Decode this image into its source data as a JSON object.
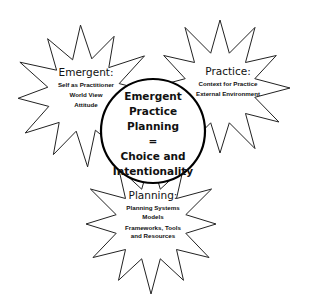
{
  "diagram": {
    "type": "concept-diagram",
    "colors": {
      "stroke": "#222222",
      "fill": "#ffffff",
      "text": "#111111",
      "hub_stroke": "#000000"
    },
    "hub": {
      "lines": [
        "Emergent",
        "Practice",
        "Planning",
        "=",
        "Choice and",
        "Intentionality"
      ]
    },
    "stars": [
      {
        "id": "emergent",
        "title": "Emergent:",
        "items": [
          "Self as Practitioner",
          "World View",
          "Attitude"
        ]
      },
      {
        "id": "practice",
        "title": "Practice:",
        "items": [
          "Context for Practice",
          "External Environment"
        ]
      },
      {
        "id": "planning",
        "title": "Planning:",
        "items": [
          "Planning Systems",
          "Models",
          "Frameworks, Tools",
          "and Resources"
        ]
      }
    ]
  }
}
